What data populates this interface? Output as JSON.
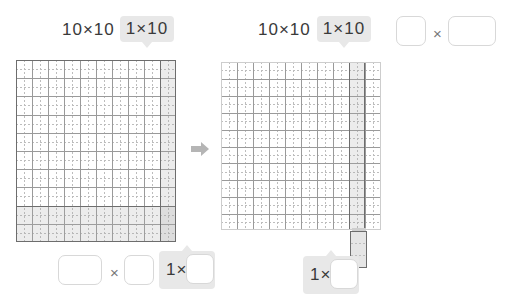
{
  "page": {
    "width": 516,
    "height": 302,
    "background": "#ffffff",
    "accent_gray": "#e8e8e8",
    "grid_line_color": "#9a9a9a",
    "grid_border_color": "#6d6d6d",
    "shade_color": "#cfcfcf"
  },
  "left_panel": {
    "labels": [
      {
        "text": "10×10",
        "highlighted": false
      },
      {
        "text": "1×10",
        "highlighted": true
      }
    ],
    "grid": {
      "columns": 10,
      "rows": 10,
      "subdivisions_per_cell": 2,
      "highlight_column": {
        "index": 10,
        "label": "1×10"
      },
      "highlight_band_rows": 2
    },
    "answers": [
      {
        "type": "box",
        "value": "",
        "width": "wide"
      },
      {
        "type": "operator",
        "value": "×"
      },
      {
        "type": "box",
        "value": "",
        "width": "narrow"
      }
    ],
    "callout": {
      "prefix": "1×",
      "box_value": "",
      "highlighted": true
    }
  },
  "right_panel": {
    "labels": [
      {
        "text": "10×10",
        "highlighted": false
      },
      {
        "text": "1×10",
        "highlighted": true
      },
      {
        "type": "box",
        "value": "",
        "width": "narrow"
      },
      {
        "type": "operator",
        "value": "×"
      },
      {
        "type": "box",
        "value": "",
        "width": "wide"
      }
    ],
    "grid": {
      "columns": 10,
      "rows": 10,
      "subdivisions_per_cell": 2,
      "highlight_column": {
        "index": 9,
        "label": "1×10"
      }
    },
    "detached_strip": {
      "units": 2,
      "orientation": "vertical"
    },
    "callout": {
      "prefix": "1×",
      "box_value": "",
      "highlighted": true
    }
  },
  "arrow": {
    "direction": "right",
    "color": "#b5b5b5"
  },
  "icons": {
    "multiply": "×",
    "arrow_right": "➡"
  }
}
